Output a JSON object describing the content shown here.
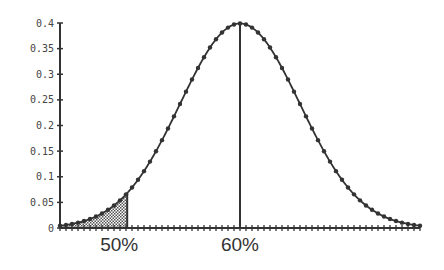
{
  "chart_data": {
    "type": "line",
    "title": "",
    "xlabel": "",
    "ylabel": "",
    "distribution": "normal",
    "ylim": [
      0,
      0.4
    ],
    "yticks": [
      0,
      0.05,
      0.1,
      0.15,
      0.2,
      0.25,
      0.3,
      0.35,
      0.4
    ],
    "ytick_labels": [
      "0",
      "0.05",
      "0.1",
      "0.15",
      "0.2",
      "0.25",
      "0.3",
      "0.35",
      "0.4"
    ],
    "x_z_range": [
      -3,
      3
    ],
    "x_minor_tick_step_z": 0.1,
    "marker_step_z": 0.1,
    "peak": {
      "label": "60%",
      "z": 0,
      "y": 0.4
    },
    "shaded_tail": {
      "label": "50%",
      "z_end": -1.88,
      "y_at_end": 0.068,
      "pattern": "checker"
    },
    "x_annotations": [
      {
        "label": "50%",
        "z": -1.88
      },
      {
        "label": "60%",
        "z": 0
      }
    ],
    "series": [
      {
        "name": "density",
        "color": "#333333"
      }
    ],
    "grid": false,
    "legend": false
  }
}
